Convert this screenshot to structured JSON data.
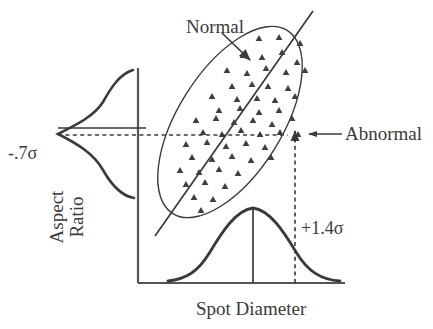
{
  "figure": {
    "axes": {
      "x_label": "Spot Diameter",
      "y_label_line1": "Aspect",
      "y_label_line2": "Ratio"
    },
    "annotations": {
      "normal": "Normal",
      "abnormal": "Abnormal",
      "sigma_low": "-.7σ",
      "sigma_high": "+1.4σ"
    },
    "colors": {
      "stroke": "#3a3a3a",
      "axis": "#555555",
      "marker": "#3f3f3f",
      "background": "#ffffff"
    }
  },
  "chart_data": {
    "type": "scatter",
    "title": "",
    "xlabel": "Spot Diameter",
    "ylabel": "Aspect Ratio",
    "grid": false,
    "legend": "none",
    "axis_style": {
      "x_axis_y": 283,
      "x_axis_x_start": 138,
      "x_axis_x_end": 345,
      "y_axis_x": 138,
      "y_axis_y_top": 68,
      "y_axis_y_bottom": 283
    },
    "annotations": [
      {
        "text": "Normal",
        "kind": "pointer-label",
        "label_x": 186,
        "label_y": 17,
        "arrow_from": [
          226,
          36
        ],
        "arrow_to": [
          252,
          62
        ]
      },
      {
        "text": "Abnormal",
        "kind": "pointer-label",
        "label_x": 345,
        "label_y": 124,
        "arrow_from": [
          341,
          134
        ],
        "arrow_to": [
          306,
          134
        ]
      },
      {
        "text": "-.7σ",
        "kind": "axis-value",
        "axis": "y",
        "value": -0.7,
        "label_x": 8,
        "label_y": 144
      },
      {
        "text": "+1.4σ",
        "kind": "axis-value",
        "axis": "x",
        "value": 1.4,
        "label_x": 301,
        "label_y": 219
      }
    ],
    "cluster_ellipse": {
      "center": [
        230,
        122
      ],
      "radius_major": 108,
      "radius_minor": 52,
      "rotation_deg": -58,
      "label": "Normal"
    },
    "regression_line": {
      "from": [
        155,
        236
      ],
      "to": [
        313,
        11
      ]
    },
    "marginal_distributions": [
      {
        "axis": "y",
        "orientation": "horizontal-bell-left",
        "peak_value": -0.7,
        "peak_point": [
          58,
          134
        ],
        "baseline_x": 138,
        "span": [
          70,
          198
        ],
        "indicator_line_y": 128
      },
      {
        "axis": "x",
        "orientation": "vertical-bell-up",
        "peak_value": 0,
        "peak_point": [
          253,
          208
        ],
        "baseline_y": 283,
        "span": [
          168,
          340
        ],
        "indicator_line_x": 253
      }
    ],
    "reference_lines": [
      {
        "kind": "dashed-horizontal",
        "value": -0.7,
        "y": 135,
        "x_from": 58,
        "x_to": 306,
        "arrow_end": "up-at-295"
      },
      {
        "kind": "dashed-vertical",
        "value": 1.4,
        "x": 295,
        "y_from": 283,
        "y_to": 133,
        "arrow_end": "up"
      }
    ],
    "marker_shape": "triangle-up",
    "marker_count": 57,
    "points": [
      [
        259,
        38
      ],
      [
        279,
        37
      ],
      [
        300,
        43
      ],
      [
        243,
        55
      ],
      [
        262,
        57
      ],
      [
        282,
        52
      ],
      [
        297,
        62
      ],
      [
        227,
        70
      ],
      [
        247,
        73
      ],
      [
        266,
        68
      ],
      [
        286,
        72
      ],
      [
        305,
        70
      ],
      [
        232,
        86
      ],
      [
        252,
        84
      ],
      [
        268,
        86
      ],
      [
        288,
        88
      ],
      [
        212,
        96
      ],
      [
        237,
        99
      ],
      [
        257,
        98
      ],
      [
        275,
        100
      ],
      [
        295,
        96
      ],
      [
        219,
        110
      ],
      [
        240,
        108
      ],
      [
        259,
        112
      ],
      [
        279,
        110
      ],
      [
        196,
        120
      ],
      [
        216,
        118
      ],
      [
        234,
        122
      ],
      [
        253,
        120
      ],
      [
        272,
        124
      ],
      [
        292,
        118
      ],
      [
        203,
        132
      ],
      [
        222,
        134
      ],
      [
        241,
        130
      ],
      [
        260,
        134
      ],
      [
        280,
        132
      ],
      [
        298,
        134
      ],
      [
        186,
        144
      ],
      [
        207,
        142
      ],
      [
        226,
        146
      ],
      [
        246,
        143
      ],
      [
        265,
        147
      ],
      [
        192,
        157
      ],
      [
        212,
        159
      ],
      [
        232,
        156
      ],
      [
        251,
        160
      ],
      [
        271,
        157
      ],
      [
        180,
        170
      ],
      [
        199,
        172
      ],
      [
        219,
        169
      ],
      [
        238,
        173
      ],
      [
        186,
        184
      ],
      [
        205,
        182
      ],
      [
        225,
        186
      ],
      [
        194,
        197
      ],
      [
        213,
        199
      ],
      [
        201,
        210
      ]
    ]
  }
}
